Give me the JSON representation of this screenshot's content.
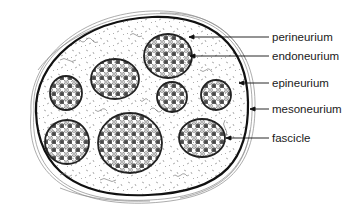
{
  "figure": {
    "colors": {
      "stroke": "#1a1a1a",
      "background": "#ffffff",
      "fiber_dark": "#555555",
      "fiber_light": "#ffffff"
    }
  },
  "labels": [
    {
      "id": "perineurium",
      "text": "perineurium",
      "x": 272,
      "y": 37,
      "line_from_x": 189,
      "line_from_y": 37
    },
    {
      "id": "endoneurium",
      "text": "endoneurium",
      "x": 272,
      "y": 56,
      "line_from_x": 190,
      "line_from_y": 56
    },
    {
      "id": "epineurium",
      "text": "epineurium",
      "x": 272,
      "y": 83,
      "line_from_x": 239,
      "line_from_y": 83
    },
    {
      "id": "mesoneurium",
      "text": "mesoneurium",
      "x": 272,
      "y": 109,
      "line_from_x": 250,
      "line_from_y": 109
    },
    {
      "id": "fascicle",
      "text": "fascicle",
      "x": 272,
      "y": 138,
      "line_from_x": 232,
      "line_from_y": 138
    }
  ],
  "fascicles": [
    {
      "cx": 168,
      "cy": 56,
      "rx": 24,
      "ry": 22
    },
    {
      "cx": 115,
      "cy": 79,
      "rx": 24,
      "ry": 20
    },
    {
      "cx": 66,
      "cy": 93,
      "rx": 16,
      "ry": 17
    },
    {
      "cx": 172,
      "cy": 97,
      "rx": 15,
      "ry": 15
    },
    {
      "cx": 216,
      "cy": 95,
      "rx": 15,
      "ry": 15
    },
    {
      "cx": 67,
      "cy": 142,
      "rx": 22,
      "ry": 22
    },
    {
      "cx": 130,
      "cy": 143,
      "rx": 32,
      "ry": 30
    },
    {
      "cx": 202,
      "cy": 138,
      "rx": 23,
      "ry": 19
    }
  ]
}
